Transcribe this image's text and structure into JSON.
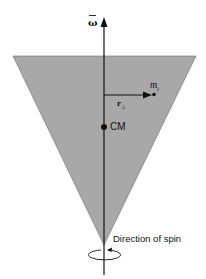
{
  "diagram": {
    "type": "spinning-top-cone",
    "colors": {
      "cone_fill": "#a8a8a8",
      "axis": "#111111",
      "background": "#ffffff"
    },
    "labels": {
      "omega": "ω",
      "mass": "m",
      "mass_sub": "i",
      "r_perp": "r",
      "r_perp_sub": "⊥",
      "center_of_mass": "CM",
      "spin_direction": "Direction of spin"
    }
  }
}
